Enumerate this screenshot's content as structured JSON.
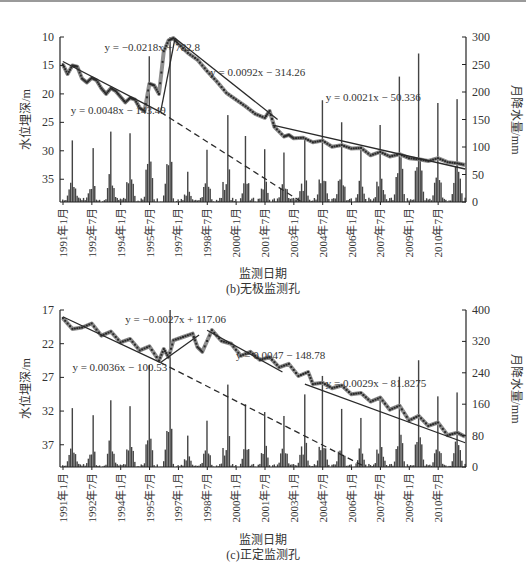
{
  "chart_data": [
    {
      "id": "b",
      "type": "line+bar",
      "title": "(b)无极监测孔",
      "xlabel": "监测日期",
      "ylabel_left": "水位埋深/m",
      "ylabel_right": "月降水量/mm",
      "x_ticks": [
        "1991年1月",
        "1992年7月",
        "1994年1月",
        "1995年7月",
        "1997年1月",
        "1998年7月",
        "2000年1月",
        "2001年7月",
        "2003年1月",
        "2004年7月",
        "2006年1月",
        "2007年7月",
        "2009年1月",
        "2010年7月"
      ],
      "x_range": [
        "1991-01",
        "2011-12"
      ],
      "y_left_ticks": [
        10,
        15,
        20,
        25,
        30,
        35
      ],
      "y_left_range": [
        10,
        39
      ],
      "y_left_inverted": true,
      "y_right_ticks": [
        0,
        50,
        100,
        150,
        200,
        250,
        300
      ],
      "y_right_range": [
        0,
        300
      ],
      "grid": false,
      "annotations": [
        {
          "text": "y = 0.0048x − 143.49",
          "x": "1991-06",
          "depth": 23.5
        },
        {
          "text": "y = −0.0218x + 782.8",
          "x": "1993-03",
          "depth": 12.5
        },
        {
          "text": "y = 0.0092x − 314.26",
          "x": "1998-09",
          "depth": 16.8
        },
        {
          "text": "y = 0.0021x − 50.336",
          "x": "2004-09",
          "depth": 21.3
        }
      ],
      "trend_lines": [
        {
          "name": "fit-1991-1996",
          "style": "solid",
          "from": [
            "1991-01",
            14.3
          ],
          "to": [
            "1996-02",
            23.2
          ]
        },
        {
          "name": "fit-rise-1996",
          "style": "solid",
          "from": [
            "1996-02",
            23.2
          ],
          "to": [
            "1996-11",
            10.2
          ]
        },
        {
          "name": "fit-1996-2001",
          "style": "solid",
          "from": [
            "1996-11",
            10.2
          ],
          "to": [
            "2002-03",
            24.5
          ]
        },
        {
          "name": "fit-2002-2011",
          "style": "solid",
          "from": [
            "2001-12",
            25.5
          ],
          "to": [
            "2011-12",
            33.2
          ]
        },
        {
          "name": "extrapolation",
          "style": "dashed",
          "from": [
            "1996-02",
            23.2
          ],
          "to": [
            "2003-06",
            39
          ]
        }
      ],
      "water_depth_series": {
        "name": "水位埋深",
        "points": [
          [
            "1991-01",
            14.8
          ],
          [
            "1991-04",
            16.5
          ],
          [
            "1991-07",
            15.0
          ],
          [
            "1991-10",
            15.2
          ],
          [
            "1992-01",
            17.3
          ],
          [
            "1992-04",
            18.0
          ],
          [
            "1992-07",
            17.2
          ],
          [
            "1992-10",
            17.6
          ],
          [
            "1993-01",
            19.0
          ],
          [
            "1993-04",
            20.0
          ],
          [
            "1993-07",
            19.0
          ],
          [
            "1993-10",
            19.5
          ],
          [
            "1994-01",
            20.5
          ],
          [
            "1994-04",
            21.5
          ],
          [
            "1994-07",
            20.7
          ],
          [
            "1994-10",
            21.0
          ],
          [
            "1995-01",
            22.5
          ],
          [
            "1995-04",
            23.0
          ],
          [
            "1995-07",
            18.2
          ],
          [
            "1995-10",
            18.5
          ],
          [
            "1996-01",
            20.0
          ],
          [
            "1996-04",
            12.5
          ],
          [
            "1996-07",
            10.6
          ],
          [
            "1996-10",
            10.2
          ],
          [
            "1997-01",
            11.2
          ],
          [
            "1997-07",
            12.8
          ],
          [
            "1998-01",
            14.0
          ],
          [
            "1998-07",
            16.0
          ],
          [
            "1999-01",
            17.8
          ],
          [
            "1999-07",
            19.8
          ],
          [
            "2000-01",
            21.0
          ],
          [
            "2000-07",
            22.2
          ],
          [
            "2001-01",
            23.5
          ],
          [
            "2001-07",
            24.2
          ],
          [
            "2001-10",
            23.0
          ],
          [
            "2002-01",
            25.8
          ],
          [
            "2002-07",
            27.5
          ],
          [
            "2002-10",
            27.2
          ],
          [
            "2003-01",
            27.8
          ],
          [
            "2003-07",
            27.7
          ],
          [
            "2004-01",
            28.5
          ],
          [
            "2004-07",
            28.2
          ],
          [
            "2005-01",
            29.3
          ],
          [
            "2005-07",
            29.0
          ],
          [
            "2006-01",
            29.6
          ],
          [
            "2006-07",
            29.5
          ],
          [
            "2007-01",
            30.8
          ],
          [
            "2007-07",
            30.2
          ],
          [
            "2008-01",
            31.0
          ],
          [
            "2008-07",
            30.6
          ],
          [
            "2009-01",
            31.3
          ],
          [
            "2009-07",
            31.5
          ],
          [
            "2010-01",
            31.8
          ],
          [
            "2010-07",
            31.3
          ],
          [
            "2011-01",
            32.0
          ],
          [
            "2011-07",
            32.2
          ],
          [
            "2011-12",
            32.5
          ]
        ]
      },
      "precipitation_series": {
        "name": "月降水量",
        "peaks_mm": [
          [
            "1991-07",
            112
          ],
          [
            "1992-08",
            98
          ],
          [
            "1993-07",
            128
          ],
          [
            "1994-07",
            125
          ],
          [
            "1995-07",
            265
          ],
          [
            "1996-08",
            300
          ],
          [
            "1997-07",
            55
          ],
          [
            "1998-07",
            95
          ],
          [
            "1999-08",
            158
          ],
          [
            "2000-07",
            120
          ],
          [
            "2001-07",
            96
          ],
          [
            "2002-07",
            90
          ],
          [
            "2003-08",
            118
          ],
          [
            "2004-07",
            185
          ],
          [
            "2005-07",
            145
          ],
          [
            "2006-07",
            102
          ],
          [
            "2007-07",
            140
          ],
          [
            "2008-07",
            228
          ],
          [
            "2009-07",
            270
          ],
          [
            "2010-07",
            180
          ],
          [
            "2011-07",
            187
          ]
        ]
      }
    },
    {
      "id": "c",
      "type": "line+bar",
      "title": "(c)正定监测孔",
      "xlabel": "监测日期",
      "ylabel_left": "水位埋深/m",
      "ylabel_right": "月降水量/mm",
      "x_ticks": [
        "1991年1月",
        "1992年7月",
        "1994年1月",
        "1995年7月",
        "1997年1月",
        "1998年7月",
        "2000年1月",
        "2001年7月",
        "2003年1月",
        "2004年7月",
        "2006年1月",
        "2007年7月",
        "2009年1月",
        "2010年7月"
      ],
      "x_range": [
        "1991-01",
        "2011-12"
      ],
      "y_left_ticks": [
        17,
        22,
        27,
        32,
        37
      ],
      "y_left_range": [
        17,
        40.3
      ],
      "y_left_inverted": true,
      "y_right_ticks": [
        0,
        80,
        160,
        240,
        320,
        400
      ],
      "y_right_range": [
        0,
        400
      ],
      "grid": false,
      "annotations": [
        {
          "text": "y = 0.0036x − 100.53",
          "x": "1991-07",
          "depth": 26.0
        },
        {
          "text": "y = −0.0027x + 117.06",
          "x": "1994-04",
          "depth": 19.0
        },
        {
          "text": "y = 0.0047 − 148.78",
          "x": "2000-01",
          "depth": 24.2
        },
        {
          "text": "y = 0.0029x − 81.8275",
          "x": "2004-09",
          "depth": 28.5
        }
      ],
      "trend_lines": [
        {
          "name": "fit-1991-1996",
          "style": "solid",
          "from": [
            "1991-01",
            18.0
          ],
          "to": [
            "1996-02",
            24.8
          ]
        },
        {
          "name": "fit-rise-1996",
          "style": "solid",
          "from": [
            "1996-02",
            24.8
          ],
          "to": [
            "1998-02",
            20.7
          ]
        },
        {
          "name": "fit-1998-2002",
          "style": "solid",
          "from": [
            "1998-07",
            20.0
          ],
          "to": [
            "2002-06",
            26.2
          ]
        },
        {
          "name": "fit-2003-2011",
          "style": "solid",
          "from": [
            "2003-08",
            28.0
          ],
          "to": [
            "2011-12",
            36.7
          ]
        },
        {
          "name": "extrapolation",
          "style": "dashed",
          "from": [
            "1996-02",
            24.8
          ],
          "to": [
            "2006-09",
            40.2
          ]
        }
      ],
      "water_depth_series": {
        "name": "水位埋深",
        "points": [
          [
            "1991-01",
            18.2
          ],
          [
            "1991-07",
            19.8
          ],
          [
            "1992-01",
            19.6
          ],
          [
            "1992-07",
            19.0
          ],
          [
            "1993-01",
            20.8
          ],
          [
            "1993-07",
            20.2
          ],
          [
            "1994-01",
            21.8
          ],
          [
            "1994-07",
            21.3
          ],
          [
            "1995-01",
            23.0
          ],
          [
            "1995-07",
            22.4
          ],
          [
            "1996-01",
            24.5
          ],
          [
            "1996-04",
            22.8
          ],
          [
            "1996-07",
            24.0
          ],
          [
            "1996-10",
            21.5
          ],
          [
            "1997-04",
            21.0
          ],
          [
            "1997-10",
            20.5
          ],
          [
            "1998-01",
            22.5
          ],
          [
            "1998-04",
            23.2
          ],
          [
            "1998-10",
            20.0
          ],
          [
            "1999-04",
            21.6
          ],
          [
            "1999-10",
            22.0
          ],
          [
            "2000-04",
            23.8
          ],
          [
            "2000-10",
            23.2
          ],
          [
            "2001-04",
            24.4
          ],
          [
            "2001-10",
            24.0
          ],
          [
            "2002-04",
            25.5
          ],
          [
            "2002-10",
            25.0
          ],
          [
            "2003-04",
            26.8
          ],
          [
            "2003-10",
            26.2
          ],
          [
            "2004-01",
            28.0
          ],
          [
            "2004-07",
            27.8
          ],
          [
            "2005-01",
            28.6
          ],
          [
            "2005-07",
            28.2
          ],
          [
            "2006-01",
            29.5
          ],
          [
            "2006-07",
            29.3
          ],
          [
            "2007-01",
            30.6
          ],
          [
            "2007-07",
            30.0
          ],
          [
            "2008-01",
            31.8
          ],
          [
            "2008-07",
            31.2
          ],
          [
            "2009-01",
            33.4
          ],
          [
            "2009-07",
            32.7
          ],
          [
            "2010-01",
            34.2
          ],
          [
            "2010-07",
            33.7
          ],
          [
            "2011-01",
            35.6
          ],
          [
            "2011-07",
            35.2
          ],
          [
            "2011-12",
            35.8
          ]
        ]
      },
      "precipitation_series": {
        "name": "月降水量",
        "peaks_mm": [
          [
            "1991-07",
            150
          ],
          [
            "1992-08",
            132
          ],
          [
            "1993-07",
            170
          ],
          [
            "1994-07",
            155
          ],
          [
            "1995-07",
            260
          ],
          [
            "1996-08",
            400
          ],
          [
            "1997-07",
            80
          ],
          [
            "1998-07",
            118
          ],
          [
            "1999-08",
            210
          ],
          [
            "2000-07",
            160
          ],
          [
            "2001-07",
            140
          ],
          [
            "2002-07",
            130
          ],
          [
            "2003-08",
            185
          ],
          [
            "2004-07",
            232
          ],
          [
            "2005-07",
            148
          ],
          [
            "2006-07",
            125
          ],
          [
            "2007-07",
            168
          ],
          [
            "2008-07",
            230
          ],
          [
            "2009-07",
            272
          ],
          [
            "2010-07",
            180
          ],
          [
            "2011-07",
            190
          ]
        ]
      }
    }
  ],
  "panels": {
    "b": {
      "xlabel": "监测日期",
      "caption": "(b)无极监测孔"
    },
    "c": {
      "xlabel": "监测日期",
      "caption": "(c)正定监测孔"
    }
  },
  "colors": {
    "axis": "#222222",
    "bar": "#444444",
    "depth_line": "#8f8f8f",
    "depth_marker": "#2a2a2a",
    "trend": "#2a2a2a",
    "text": "#333333"
  }
}
